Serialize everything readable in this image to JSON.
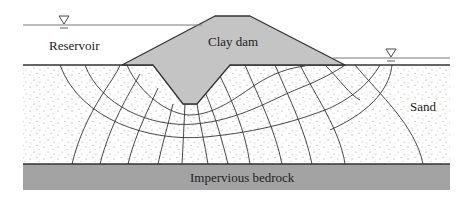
{
  "diagram": {
    "type": "flow-net-cross-section",
    "labels": {
      "reservoir": "Reservoir",
      "dam": "Clay dam",
      "sand": "Sand",
      "bedrock": "Impervious bedrock"
    },
    "symbols": {
      "upstream_water_level": "water-table-triangle",
      "downstream_water_level": "water-table-triangle"
    },
    "colors": {
      "dam_fill": "#c4c4c4",
      "bedrock_fill": "#a3a3a3",
      "sand_fill": "#ffffff",
      "stipple": "#8a8a8a",
      "line": "#333333"
    }
  }
}
